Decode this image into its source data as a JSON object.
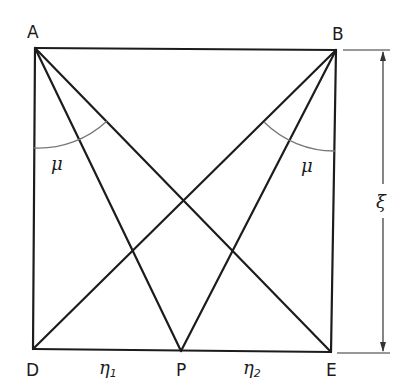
{
  "diagram": {
    "points": {
      "A": {
        "label": "A",
        "x": 35,
        "y": 48
      },
      "B": {
        "label": "B",
        "x": 336,
        "y": 50
      },
      "D": {
        "label": "D",
        "x": 33,
        "y": 349
      },
      "E": {
        "label": "E",
        "x": 331,
        "y": 352
      },
      "P": {
        "label": "P",
        "x": 181,
        "y": 351
      }
    },
    "angle_labels": {
      "left": "μ",
      "right": "μ"
    },
    "segment_labels": {
      "eta1": {
        "symbol": "η",
        "subscript": "1"
      },
      "eta2": {
        "symbol": "η",
        "subscript": "2"
      }
    },
    "dimension": {
      "label": "ξ"
    },
    "colors": {
      "line": "#1c1c1c",
      "arc": "#777777"
    }
  }
}
